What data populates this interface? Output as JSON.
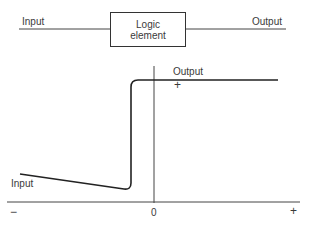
{
  "block_diagram": {
    "input_label": "Input",
    "element_label_line1": "Logic",
    "element_label_line2": "element",
    "output_label": "Output"
  },
  "graph": {
    "output_label": "Output",
    "output_marker": "+",
    "input_label": "Input",
    "x_axis_ticks": {
      "negative": "−",
      "zero": "0",
      "positive": "+"
    }
  },
  "colors": {
    "line": "#222222",
    "axis": "#444444",
    "text": "#3a3a3a"
  }
}
